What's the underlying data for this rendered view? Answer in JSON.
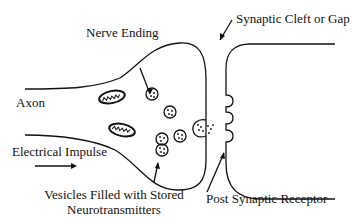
{
  "diagram": {
    "labels": {
      "nerve_ending": "Nerve Ending",
      "synaptic_cleft": "Synaptic Cleft or Gap",
      "axon": "Axon",
      "electrical_impulse": "Electrical Impulse",
      "vesicles_line1": "Vesicles Filled with Stored",
      "vesicles_line2": "Neurotransmitters",
      "post_synaptic_receptor": "Post Synaptic Receptor"
    },
    "colors": {
      "stroke": "#111111",
      "background": "#ffffff"
    }
  }
}
